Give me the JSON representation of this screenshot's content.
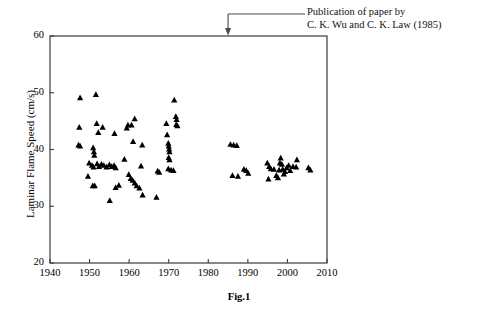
{
  "figure": {
    "caption": "Fig.1",
    "background": "#ffffff",
    "marker_color": "#000000",
    "axis_color": "#3a3a3a"
  },
  "annotation": {
    "line1": "Publication of paper by",
    "line2": "C. K. Wu and C. K. Law (1985)",
    "pointer_year": 1985,
    "pointer_label": "arrow-to-1985"
  },
  "chart_data": {
    "type": "scatter",
    "title": "",
    "xlabel": "",
    "ylabel": "Laminar Flame Speed (cm/s)",
    "xlim": [
      1940,
      2010
    ],
    "ylim": [
      20,
      60
    ],
    "xticks": [
      1940,
      1950,
      1960,
      1970,
      1980,
      1990,
      2000,
      2010
    ],
    "yticks": [
      20,
      30,
      40,
      50,
      60
    ],
    "xtick_labels": [
      "1940",
      "1950",
      "1960",
      "1970",
      "1980",
      "1990",
      "2000",
      "2010"
    ],
    "ytick_labels": [
      "20",
      "30",
      "40",
      "50",
      "60"
    ],
    "grid": false,
    "legend": false,
    "marker": "triangle-up",
    "series": [
      {
        "name": "Laminar flame speed measurements",
        "points": [
          [
            1947.6,
            49.1
          ],
          [
            1951.6,
            49.7
          ],
          [
            1947.4,
            43.9
          ],
          [
            1951.8,
            44.6
          ],
          [
            1953.3,
            43.9
          ],
          [
            1952.2,
            43.0
          ],
          [
            1956.3,
            42.8
          ],
          [
            1947.2,
            40.8
          ],
          [
            1947.6,
            40.6
          ],
          [
            1950.9,
            40.3
          ],
          [
            1951.1,
            39.6
          ],
          [
            1951.2,
            39.0
          ],
          [
            1949.9,
            37.6
          ],
          [
            1950.6,
            37.2
          ],
          [
            1951.0,
            36.9
          ],
          [
            1951.9,
            37.5
          ],
          [
            1952.4,
            37.0
          ],
          [
            1953.0,
            37.4
          ],
          [
            1953.6,
            37.2
          ],
          [
            1954.3,
            36.9
          ],
          [
            1955.0,
            37.3
          ],
          [
            1955.6,
            37.0
          ],
          [
            1956.2,
            37.2
          ],
          [
            1956.6,
            36.8
          ],
          [
            1949.6,
            35.3
          ],
          [
            1950.8,
            33.6
          ],
          [
            1951.3,
            33.6
          ],
          [
            1955.1,
            31.0
          ],
          [
            1956.6,
            33.3
          ],
          [
            1957.4,
            33.7
          ],
          [
            1958.8,
            38.3
          ],
          [
            1959.4,
            43.8
          ],
          [
            1959.7,
            44.3
          ],
          [
            1960.6,
            44.3
          ],
          [
            1961.4,
            45.4
          ],
          [
            1961.0,
            41.4
          ],
          [
            1963.3,
            40.8
          ],
          [
            1963.0,
            37.1
          ],
          [
            1959.9,
            35.6
          ],
          [
            1960.4,
            34.9
          ],
          [
            1960.9,
            34.6
          ],
          [
            1961.4,
            34.1
          ],
          [
            1961.9,
            33.6
          ],
          [
            1962.6,
            33.2
          ],
          [
            1963.4,
            32.0
          ],
          [
            1966.9,
            31.6
          ],
          [
            1967.2,
            36.2
          ],
          [
            1967.6,
            36.0
          ],
          [
            1969.4,
            44.6
          ],
          [
            1969.6,
            42.6
          ],
          [
            1969.9,
            41.1
          ],
          [
            1970.0,
            40.6
          ],
          [
            1970.1,
            40.1
          ],
          [
            1970.2,
            39.6
          ],
          [
            1970.0,
            38.6
          ],
          [
            1970.2,
            38.2
          ],
          [
            1969.9,
            36.6
          ],
          [
            1970.6,
            36.4
          ],
          [
            1971.2,
            36.3
          ],
          [
            1971.4,
            48.7
          ],
          [
            1971.8,
            45.8
          ],
          [
            1972.0,
            45.3
          ],
          [
            1971.9,
            44.4
          ],
          [
            1972.2,
            44.2
          ],
          [
            1985.6,
            40.9
          ],
          [
            1986.4,
            40.8
          ],
          [
            1987.2,
            40.7
          ],
          [
            1986.1,
            35.4
          ],
          [
            1987.5,
            35.3
          ],
          [
            1989.0,
            36.5
          ],
          [
            1989.6,
            36.3
          ],
          [
            1990.1,
            35.8
          ],
          [
            1994.9,
            37.6
          ],
          [
            1995.4,
            37.0
          ],
          [
            1995.8,
            36.6
          ],
          [
            1995.2,
            34.8
          ],
          [
            1996.6,
            36.5
          ],
          [
            1997.2,
            35.4
          ],
          [
            1997.6,
            35.0
          ],
          [
            1997.9,
            36.4
          ],
          [
            1998.1,
            37.6
          ],
          [
            1998.3,
            38.5
          ],
          [
            1998.6,
            37.4
          ],
          [
            1998.8,
            36.5
          ],
          [
            1999.1,
            35.7
          ],
          [
            1999.4,
            36.1
          ],
          [
            1999.8,
            36.8
          ],
          [
            2000.3,
            37.2
          ],
          [
            2000.7,
            36.3
          ],
          [
            2001.4,
            37.0
          ],
          [
            2002.4,
            38.2
          ],
          [
            2002.2,
            36.9
          ],
          [
            2005.3,
            36.8
          ],
          [
            2005.8,
            36.4
          ]
        ]
      }
    ]
  }
}
